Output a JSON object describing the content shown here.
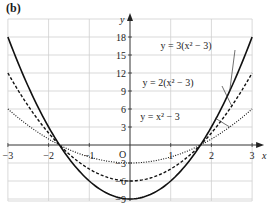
{
  "panel_label": "(b)",
  "chart_data": {
    "type": "line",
    "title": "",
    "xlabel": "x",
    "ylabel": "y",
    "origin_label": "O",
    "xlim": [
      -3,
      3
    ],
    "ylim": [
      -9.5,
      21
    ],
    "grid": true,
    "x_ticks": [
      -3,
      -2,
      -1,
      1,
      2,
      3
    ],
    "x_tick_labels": [
      "−3",
      "−2",
      "−1",
      "1",
      "2",
      "3"
    ],
    "y_ticks": [
      18,
      15,
      12,
      9,
      6,
      3,
      -3,
      -6,
      -9
    ],
    "y_tick_labels": [
      "18",
      "15",
      "12",
      "9",
      "6",
      "3",
      "−3",
      "−6",
      "−9"
    ],
    "series": [
      {
        "name": "y = 3(x² − 3)",
        "a": 3,
        "style": "solid",
        "label": "y = 3(x² − 3)",
        "label_pos": [
          186,
          49
        ]
      },
      {
        "name": "y = 2(x² − 3)",
        "a": 2,
        "style": "dashed",
        "label": "y = 2(x² − 3)",
        "label_pos": [
          168,
          86
        ]
      },
      {
        "name": "y = x² − 3",
        "a": 1,
        "style": "dotted",
        "label": "y = x² − 3",
        "label_pos": [
          160,
          120
        ]
      }
    ],
    "x": [
      -3,
      -2.5,
      -2,
      -1.732,
      -1.5,
      -1,
      -0.5,
      0,
      0.5,
      1,
      1.5,
      1.732,
      2,
      2.5,
      3
    ],
    "values": {
      "y = 3(x² − 3)": [
        18,
        9.75,
        3,
        0,
        -2.25,
        -6,
        -8.25,
        -9,
        -8.25,
        -6,
        -2.25,
        0,
        3,
        9.75,
        18
      ],
      "y = 2(x² − 3)": [
        12,
        6.5,
        2,
        0,
        -1.5,
        -4,
        -5.5,
        -6,
        -5.5,
        -4,
        -1.5,
        0,
        2,
        6.5,
        12
      ],
      "y = x² − 3": [
        6,
        3.25,
        1,
        0,
        -0.75,
        -2,
        -2.75,
        -3,
        -2.75,
        -2,
        -0.75,
        0,
        1,
        3.25,
        6
      ]
    },
    "roots": [
      -1.732,
      1.732
    ]
  }
}
